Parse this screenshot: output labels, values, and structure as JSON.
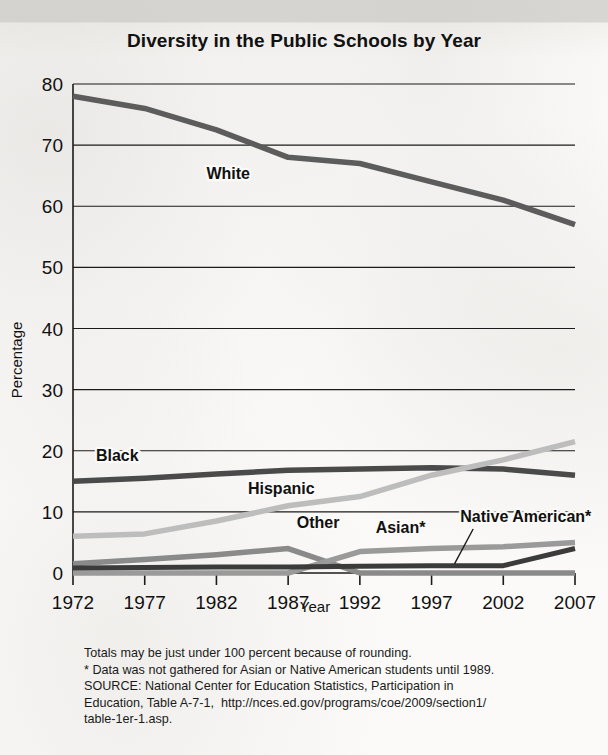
{
  "chart_data": {
    "type": "line",
    "title": "Diversity in the Public Schools by Year",
    "xlabel": "Year",
    "ylabel": "Percentage",
    "categories": [
      "1972",
      "1977",
      "1982",
      "1987",
      "1992",
      "1997",
      "2002",
      "2007"
    ],
    "x": [
      1972,
      1977,
      1982,
      1987,
      1992,
      1997,
      2002,
      2007
    ],
    "ylim": [
      0,
      80
    ],
    "yticks": [
      "0",
      "10",
      "20",
      "30",
      "40",
      "50",
      "60",
      "70",
      "80"
    ],
    "grid": true,
    "legend_position": "inline-labels",
    "series": [
      {
        "name": "White",
        "label": "White",
        "color": "#5c5c5c",
        "values": [
          78,
          76,
          72.5,
          68,
          67,
          64,
          61,
          57
        ]
      },
      {
        "name": "Black",
        "label": "Black",
        "color": "#4a4a4a",
        "values": [
          15,
          15.5,
          16.2,
          16.8,
          17,
          17.2,
          17,
          16
        ]
      },
      {
        "name": "Hispanic",
        "label": "Hispanic",
        "color": "#bdbdbd",
        "values": [
          6,
          6.4,
          8.5,
          11,
          12.5,
          16,
          18.5,
          21.5
        ]
      },
      {
        "name": "Other",
        "label": "Other",
        "color": "#8a8a8a",
        "values": [
          1.5,
          2.2,
          3,
          4,
          0,
          0,
          0,
          0
        ]
      },
      {
        "name": "Asian*",
        "label": "Asian*",
        "color": "#9a9a9a",
        "values": [
          0,
          0,
          0,
          0,
          3.5,
          4,
          4.3,
          5
        ]
      },
      {
        "name": "Native American*",
        "label": "Native American*",
        "color": "#3b3b3b",
        "values": [
          0.8,
          0.9,
          1,
          1,
          1.1,
          1.2,
          1.2,
          4
        ]
      }
    ],
    "annotations": [
      {
        "text": "White",
        "x": 1981.3,
        "y": 64.5
      },
      {
        "text": "Black",
        "x": 1973.6,
        "y": 18.4
      },
      {
        "text": "Hispanic",
        "x": 1984.2,
        "y": 12.9
      },
      {
        "text": "Other",
        "x": 1987.6,
        "y": 7.4
      },
      {
        "text": "Asian*",
        "x": 1993.1,
        "y": 6.6
      },
      {
        "text": "Native American*",
        "x": 1999.0,
        "y": 8.4
      }
    ]
  },
  "footnotes": {
    "line1": "Totals may be just under 100 percent because of rounding.",
    "line2": "* Data was not gathered for Asian or Native American students until 1989.",
    "line3": "SOURCE: National Center for Education Statistics, Participation in",
    "line4": "Education, Table A-7-1,  http://nces.ed.gov/programs/coe/2009/section1/",
    "line5": "table-1er-1.asp."
  }
}
